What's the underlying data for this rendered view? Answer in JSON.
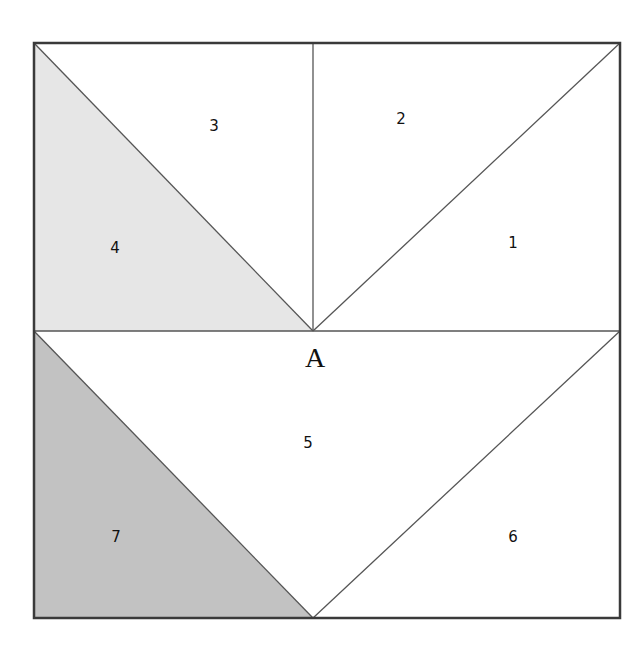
{
  "diagram": {
    "type": "quilt-block-foundation-pattern",
    "section_label": "A",
    "colors": {
      "background": "#ffffff",
      "outline": "#444444",
      "light_gray": "#e6e6e6",
      "medium_gray": "#c2c2c2"
    },
    "pieces": [
      {
        "label": "1",
        "fill": "white"
      },
      {
        "label": "2",
        "fill": "white"
      },
      {
        "label": "3",
        "fill": "white"
      },
      {
        "label": "4",
        "fill": "light_gray"
      },
      {
        "label": "5",
        "fill": "white"
      },
      {
        "label": "6",
        "fill": "white"
      },
      {
        "label": "7",
        "fill": "medium_gray"
      }
    ]
  }
}
